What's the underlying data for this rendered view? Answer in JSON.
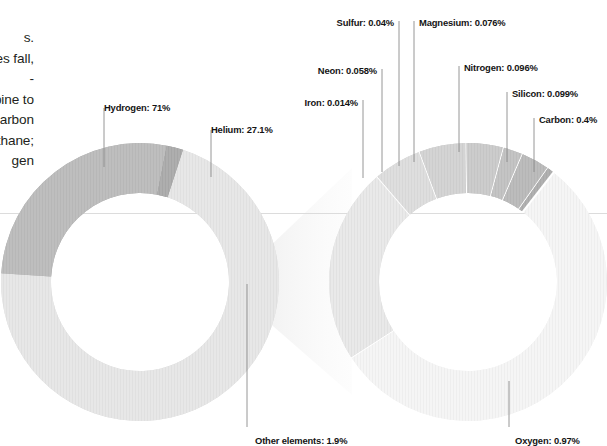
{
  "figure": {
    "body_text": "s.\nures fall,\n-\nbine to\ncarbon\nethane;\ngen",
    "baseline_rule_color": "#d9d9d9"
  },
  "chart_data": [
    {
      "type": "pie",
      "id": "jupiter-main-composition",
      "title": "",
      "subtype": "donut",
      "center": [
        140,
        282
      ],
      "outer_radius": 139,
      "inner_radius": 89,
      "start_angle_deg": -72,
      "categories": [
        "Hydrogen",
        "Helium",
        "Other elements"
      ],
      "values": [
        71,
        27.1,
        1.9
      ],
      "labels": [
        "Hydrogen: 71%",
        "Helium: 27.1%",
        "Other elements: 1.9%"
      ],
      "colors": [
        "#c9c9c9",
        "#6e6e6e",
        "#4a4a4a"
      ],
      "units": "%"
    },
    {
      "type": "pie",
      "id": "other-elements-breakdown",
      "title": "",
      "subtype": "donut",
      "center": [
        468,
        282
      ],
      "outer_radius": 139,
      "inner_radius": 89,
      "start_angle_deg": -52,
      "categories": [
        "Oxygen",
        "Carbon",
        "Silicon",
        "Nitrogen",
        "Magnesium",
        "Sulfur",
        "Neon",
        "Iron"
      ],
      "values": [
        0.97,
        0.4,
        0.099,
        0.096,
        0.076,
        0.04,
        0.058,
        0.014
      ],
      "labels": [
        "Oxygen: 0.97%",
        "Carbon: 0.4%",
        "Silicon: 0.099%",
        "Nitrogen: 0.096%",
        "Magnesium: 0.076%",
        "Sulfur: 0.04%",
        "Neon: 0.058%",
        "Iron: 0.014%"
      ],
      "colors": [
        "#e9e9e9",
        "#cdcdcd",
        "#b6b6b6",
        "#a0a0a0",
        "#8d8d8d",
        "#7c7c7c",
        "#6a6a6a",
        "#4f4f4f"
      ],
      "units": "%"
    }
  ],
  "annotations": {
    "left": [
      {
        "key": "hydrogen",
        "text": "Hydrogen: 71%",
        "x": 104,
        "y": 102,
        "align": "left",
        "lx": 104,
        "ly1": 108,
        "ly2": 167
      },
      {
        "key": "helium",
        "text": "Helium: 27.1%",
        "x": 211,
        "y": 124,
        "align": "left",
        "lx": 211,
        "ly1": 130,
        "ly2": 177
      },
      {
        "key": "other",
        "text": "Other elements: 1.9%",
        "x": 255,
        "y": 435,
        "align": "left",
        "lx": 247,
        "ly1": 284,
        "ly2": 427
      }
    ],
    "right": [
      {
        "key": "iron",
        "text": "Iron: 0.014%",
        "x": 358,
        "y": 97,
        "align": "right",
        "lx": 363,
        "ly1": 100,
        "ly2": 178
      },
      {
        "key": "neon",
        "text": "Neon: 0.058%",
        "x": 377,
        "y": 65,
        "align": "right",
        "lx": 382,
        "ly1": 69,
        "ly2": 172
      },
      {
        "key": "sulfur",
        "text": "Sulfur: 0.04%",
        "x": 394,
        "y": 17,
        "align": "right",
        "lx": 399,
        "ly1": 21,
        "ly2": 166
      },
      {
        "key": "magnesium",
        "text": "Magnesium: 0.076%",
        "x": 419,
        "y": 17,
        "align": "left",
        "lx": 414,
        "ly1": 21,
        "ly2": 162
      },
      {
        "key": "nitrogen",
        "text": "Nitrogen: 0.096%",
        "x": 464,
        "y": 62,
        "align": "left",
        "lx": 459,
        "ly1": 66,
        "ly2": 152
      },
      {
        "key": "silicon",
        "text": "Silicon: 0.099%",
        "x": 512,
        "y": 88,
        "align": "left",
        "lx": 507,
        "ly1": 92,
        "ly2": 162
      },
      {
        "key": "carbon",
        "text": "Carbon: 0.4%",
        "x": 539,
        "y": 114,
        "align": "left",
        "lx": 534,
        "ly1": 118,
        "ly2": 172
      },
      {
        "key": "oxygen",
        "text": "Oxygen: 0.97%",
        "x": 515,
        "y": 435,
        "align": "left",
        "lx": 509,
        "ly1": 381,
        "ly2": 427
      }
    ]
  }
}
